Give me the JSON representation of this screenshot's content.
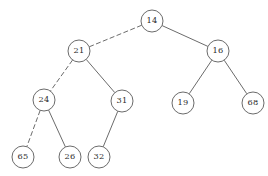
{
  "figure": {
    "title_fragment": "",
    "background_color": "#ffffff",
    "stroke_color": "#5a5a5a",
    "text_color": "#2b2b2b",
    "width": 268,
    "height": 176
  },
  "chart_data": {
    "type": "diagram",
    "diagram_kind": "binary-search-tree",
    "title": "",
    "nodes": [
      {
        "id": "n14",
        "label": "14",
        "cx": 152,
        "cy": 21,
        "r": 11,
        "level": 0
      },
      {
        "id": "n21",
        "label": "21",
        "cx": 79,
        "cy": 51,
        "r": 11,
        "level": 1
      },
      {
        "id": "n16",
        "label": "16",
        "cx": 218,
        "cy": 51,
        "r": 11,
        "level": 1
      },
      {
        "id": "n24",
        "label": "24",
        "cx": 44,
        "cy": 100,
        "r": 11,
        "level": 2
      },
      {
        "id": "n31",
        "label": "31",
        "cx": 122,
        "cy": 101,
        "r": 11,
        "level": 2
      },
      {
        "id": "n19",
        "label": "19",
        "cx": 183,
        "cy": 103,
        "r": 11,
        "level": 2
      },
      {
        "id": "n68",
        "label": "68",
        "cx": 253,
        "cy": 103,
        "r": 11,
        "level": 2
      },
      {
        "id": "n65",
        "label": "65",
        "cx": 23,
        "cy": 157,
        "r": 11,
        "level": 3
      },
      {
        "id": "n26",
        "label": "26",
        "cx": 70,
        "cy": 157,
        "r": 11,
        "level": 3
      },
      {
        "id": "n32",
        "label": "32",
        "cx": 99,
        "cy": 157,
        "r": 11,
        "level": 3
      }
    ],
    "edges": [
      {
        "from": "n14",
        "to": "n21",
        "style": "dashed"
      },
      {
        "from": "n14",
        "to": "n16",
        "style": "solid"
      },
      {
        "from": "n21",
        "to": "n24",
        "style": "dashed"
      },
      {
        "from": "n21",
        "to": "n31",
        "style": "solid"
      },
      {
        "from": "n16",
        "to": "n19",
        "style": "solid"
      },
      {
        "from": "n16",
        "to": "n68",
        "style": "solid"
      },
      {
        "from": "n24",
        "to": "n65",
        "style": "dashed"
      },
      {
        "from": "n24",
        "to": "n26",
        "style": "solid"
      },
      {
        "from": "n31",
        "to": "n32",
        "style": "solid"
      }
    ],
    "legend": []
  }
}
